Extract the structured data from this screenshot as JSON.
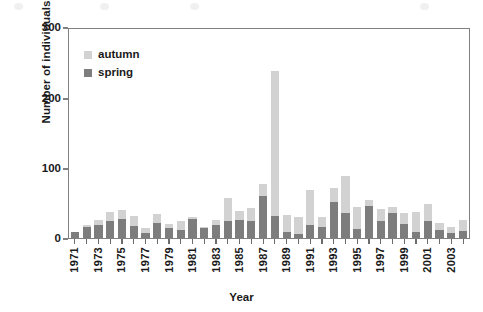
{
  "chart_data": {
    "type": "bar",
    "subtype": "stacked-vertical",
    "title": "",
    "xlabel": "Year",
    "ylabel": "Number of individuals",
    "ylim": [
      0,
      300
    ],
    "yticks": [
      0,
      100,
      200,
      300
    ],
    "grid": false,
    "legend_position": "upper-left-inside",
    "categories": [
      "1971",
      "1972",
      "1973",
      "1974",
      "1975",
      "1976",
      "1977",
      "1978",
      "1979",
      "1980",
      "1981",
      "1982",
      "1983",
      "1984",
      "1985",
      "1986",
      "1987",
      "1988",
      "1989",
      "1990",
      "1991",
      "1992",
      "1993",
      "1994",
      "1995",
      "1996",
      "1997",
      "1998",
      "1999",
      "2000",
      "2001",
      "2002",
      "2003",
      "2004"
    ],
    "xtick_labels": [
      "1971",
      "",
      "1973",
      "",
      "1975",
      "",
      "1977",
      "",
      "1979",
      "",
      "1981",
      "",
      "1983",
      "",
      "1985",
      "",
      "1987",
      "",
      "1989",
      "",
      "1991",
      "",
      "1993",
      "",
      "1995",
      "",
      "1997",
      "",
      "1999",
      "",
      "2001",
      "",
      "2003",
      ""
    ],
    "series": [
      {
        "name": "spring",
        "color": "#7d7d7d",
        "values": [
          8,
          16,
          18,
          25,
          27,
          17,
          7,
          22,
          15,
          11,
          28,
          14,
          19,
          24,
          26,
          25,
          60,
          32,
          9,
          6,
          18,
          16,
          51,
          36,
          13,
          46,
          24,
          36,
          20,
          8,
          25,
          11,
          7,
          10
        ]
      },
      {
        "name": "autumn",
        "color": "#d2d2d2",
        "values": [
          1,
          2,
          8,
          13,
          13,
          15,
          8,
          13,
          5,
          13,
          2,
          2,
          7,
          33,
          13,
          18,
          18,
          208,
          24,
          24,
          51,
          14,
          21,
          53,
          32,
          8,
          18,
          8,
          16,
          30,
          24,
          10,
          9,
          16
        ]
      }
    ],
    "totals": [
      9,
      18,
      26,
      38,
      40,
      32,
      15,
      35,
      20,
      24,
      30,
      16,
      26,
      57,
      39,
      43,
      78,
      240,
      33,
      30,
      69,
      30,
      72,
      89,
      45,
      54,
      42,
      44,
      36,
      38,
      49,
      21,
      16,
      26
    ]
  },
  "legend": {
    "items": [
      {
        "label": "autumn",
        "color": "#d2d2d2"
      },
      {
        "label": "spring",
        "color": "#7d7d7d"
      }
    ]
  },
  "axes": {
    "y_title": "Number of individuals",
    "x_title": "Year",
    "y_tick_labels": [
      "300",
      "200",
      "100",
      "0"
    ]
  },
  "colors": {
    "autumn": "#d2d2d2",
    "spring": "#7d7d7d",
    "frame": "#808080",
    "text": "#1a1a1a",
    "background": "#ffffff"
  }
}
